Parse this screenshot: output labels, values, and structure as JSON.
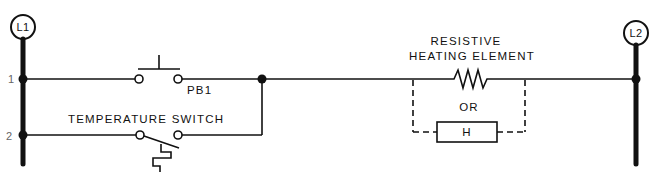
{
  "diagram": {
    "type": "ladder-diagram",
    "rails": {
      "left": {
        "label": "L1"
      },
      "right": {
        "label": "L2"
      }
    },
    "rungs": [
      {
        "number": "1",
        "component": "PB1",
        "component_type": "normally-open-pushbutton"
      },
      {
        "number": "2",
        "component": "TEMPERATURE SWITCH",
        "component_type": "normally-closed-temperature-switch"
      }
    ],
    "load": {
      "label_line1": "RESISTIVE",
      "label_line2": "HEATING ELEMENT",
      "alternative_label": "OR",
      "alternative_symbol": "H"
    },
    "colors": {
      "line": "#111111",
      "background": "#ffffff"
    }
  }
}
